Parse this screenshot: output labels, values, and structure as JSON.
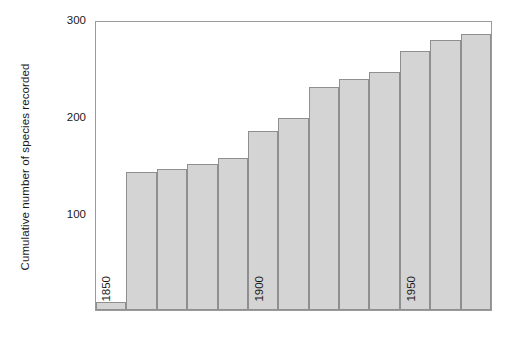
{
  "chart_data": {
    "type": "bar",
    "title": "",
    "xlabel": "",
    "ylabel": "Cumulative number of species recorded",
    "xlim": [
      1850,
      1980
    ],
    "ylim": [
      0,
      300
    ],
    "grid": false,
    "legend": null,
    "bar_width_years": 10,
    "x_major_ticks": [
      1850,
      1900,
      1950
    ],
    "x_major_tick_labels": [
      "1850",
      "1900",
      "1950"
    ],
    "y_major_ticks": [
      100,
      200,
      300
    ],
    "y_major_tick_labels": [
      "100",
      "200",
      "300"
    ],
    "y_minor_ticks": [
      50,
      150,
      250
    ],
    "bar_fill_color": "#d4d4d4",
    "bar_edge_color": "#8f8f8f",
    "axis_color": "#9a9a9a",
    "categories": [
      "1850",
      "1860",
      "1870",
      "1880",
      "1890",
      "1900",
      "1910",
      "1920",
      "1930",
      "1940",
      "1950",
      "1960",
      "1970"
    ],
    "x": [
      1850,
      1860,
      1870,
      1880,
      1890,
      1900,
      1910,
      1920,
      1930,
      1940,
      1950,
      1960,
      1970
    ],
    "values": [
      8,
      144,
      147,
      152,
      158,
      186,
      200,
      232,
      241,
      248,
      270,
      281,
      288
    ]
  },
  "caption": {
    "text": ""
  }
}
